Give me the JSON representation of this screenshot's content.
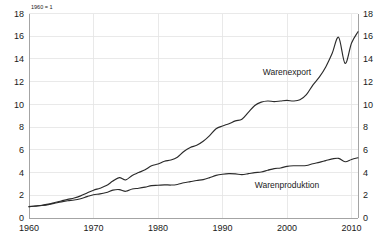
{
  "chart_data": {
    "type": "line",
    "title": "",
    "subtitle": "",
    "note": "1960 = 1",
    "xlabel": "",
    "ylabel": "",
    "xlim": [
      1960,
      2011
    ],
    "ylim": [
      0,
      18
    ],
    "grid": true,
    "legend_position": "inline-annotation",
    "dual_axis": true,
    "x_ticks": [
      1960,
      1970,
      1980,
      1990,
      2000,
      2010
    ],
    "x_tick_labels": [
      "1960",
      "1970",
      "1980",
      "1990",
      "2000",
      "2010"
    ],
    "y_ticks": [
      0,
      2,
      4,
      6,
      8,
      10,
      12,
      14,
      16,
      18
    ],
    "y_tick_labels_left": [
      "0",
      "2",
      "4",
      "6",
      "8",
      "10",
      "12",
      "14",
      "16",
      "18"
    ],
    "y_tick_labels_right": [
      "0",
      "2",
      "4",
      "6",
      "8",
      "10",
      "12",
      "14",
      "16",
      "18"
    ],
    "x": [
      1960,
      1961,
      1962,
      1963,
      1964,
      1965,
      1966,
      1967,
      1968,
      1969,
      1970,
      1971,
      1972,
      1973,
      1974,
      1975,
      1976,
      1977,
      1978,
      1979,
      1980,
      1981,
      1982,
      1983,
      1984,
      1985,
      1986,
      1987,
      1988,
      1989,
      1990,
      1991,
      1992,
      1993,
      1994,
      1995,
      1996,
      1997,
      1998,
      1999,
      2000,
      2001,
      2002,
      2003,
      2004,
      2005,
      2006,
      2007,
      2008,
      2009,
      2010,
      2011
    ],
    "series": [
      {
        "name": "Warenexport",
        "color": "#2b2b2b",
        "label_x": 2000,
        "label_y": 12.6,
        "values": [
          1.0,
          1.06,
          1.12,
          1.22,
          1.36,
          1.5,
          1.64,
          1.76,
          1.95,
          2.2,
          2.45,
          2.62,
          2.85,
          3.25,
          3.55,
          3.35,
          3.75,
          4.0,
          4.25,
          4.6,
          4.75,
          5.0,
          5.1,
          5.35,
          5.85,
          6.2,
          6.4,
          6.75,
          7.25,
          7.85,
          8.1,
          8.3,
          8.55,
          8.7,
          9.3,
          9.9,
          10.2,
          10.3,
          10.25,
          10.3,
          10.35,
          10.3,
          10.4,
          10.85,
          11.7,
          12.4,
          13.3,
          14.5,
          15.9,
          13.6,
          15.4,
          16.4
        ]
      },
      {
        "name": "Warenproduktion",
        "color": "#2b2b2b",
        "label_x": 2000,
        "label_y": 2.6,
        "values": [
          1.0,
          1.05,
          1.1,
          1.18,
          1.3,
          1.42,
          1.52,
          1.58,
          1.7,
          1.88,
          2.05,
          2.12,
          2.25,
          2.45,
          2.5,
          2.35,
          2.55,
          2.62,
          2.72,
          2.85,
          2.88,
          2.92,
          2.9,
          2.95,
          3.1,
          3.2,
          3.3,
          3.38,
          3.55,
          3.75,
          3.85,
          3.9,
          3.88,
          3.82,
          3.9,
          4.0,
          4.05,
          4.2,
          4.35,
          4.4,
          4.55,
          4.6,
          4.6,
          4.62,
          4.78,
          4.9,
          5.05,
          5.2,
          5.25,
          4.95,
          5.15,
          5.3
        ]
      }
    ]
  }
}
